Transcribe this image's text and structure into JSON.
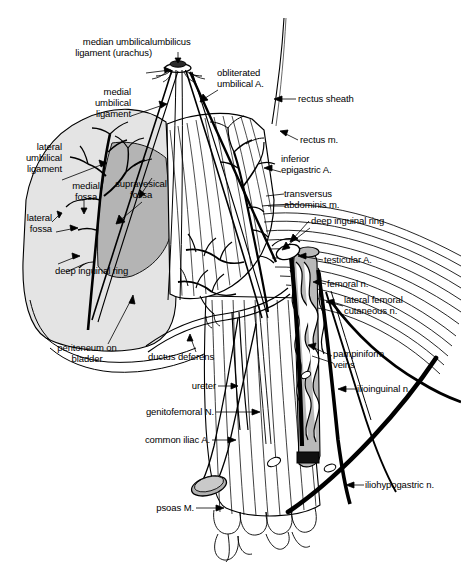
{
  "figure": {
    "width": 461,
    "height": 574,
    "background": "#ffffff",
    "ink": "#000000",
    "shade_light": "#e2e2e2",
    "shade_mid": "#c9c9c9",
    "shade_dark": "#9e9e9e"
  },
  "labels": [
    {
      "id": "umbilicus",
      "text": "umbilicus",
      "x": 152,
      "y": 41,
      "align": "l"
    },
    {
      "id": "median-umbilical-ligament",
      "text": "median umbilical\nligament (urachus)",
      "x": 55,
      "y": 54,
      "align": "l"
    },
    {
      "id": "medial-umbilical-ligament",
      "text": "medial\numbilical\nligament",
      "x": 79,
      "y": 91,
      "align": "l"
    },
    {
      "id": "lateral-umbilical-ligament",
      "text": "lateral\numbilical\nligament",
      "x": 25,
      "y": 145,
      "align": "l"
    },
    {
      "id": "medial-fossa",
      "text": "medial\nfossa",
      "x": 72,
      "y": 184,
      "align": "l"
    },
    {
      "id": "supravesical-fossa",
      "text": "supravesical\nfossa",
      "x": 108,
      "y": 182,
      "align": "l"
    },
    {
      "id": "lateral-fossa",
      "text": "lateral\nfossa",
      "x": 23,
      "y": 215,
      "align": "l"
    },
    {
      "id": "deep-inguinal-ring-left",
      "text": "deep inguinal ring",
      "x": 55,
      "y": 269,
      "align": "l"
    },
    {
      "id": "peritoneum-on-bladder",
      "text": "peritoneum on\nbladder",
      "x": 57,
      "y": 347,
      "align": "l"
    },
    {
      "id": "ductus-deferens",
      "text": "ductus deferens",
      "x": 148,
      "y": 355,
      "align": "l"
    },
    {
      "id": "ureter",
      "text": "ureter",
      "x": 189,
      "y": 382,
      "align": "l"
    },
    {
      "id": "genitofemoral-nerve",
      "text": "genitofemoral N.",
      "x": 141,
      "y": 409,
      "align": "l"
    },
    {
      "id": "common-iliac-artery",
      "text": "common iliac A.",
      "x": 139,
      "y": 436,
      "align": "l"
    },
    {
      "id": "psoas-muscle",
      "text": "psoas M.",
      "x": 156,
      "y": 504,
      "align": "l"
    },
    {
      "id": "obliterated-umbilical-artery",
      "text": "obliterated\numbilical A.",
      "x": 217,
      "y": 71,
      "align": "l"
    },
    {
      "id": "rectus-sheath",
      "text": "rectus sheath",
      "x": 298,
      "y": 95,
      "align": "l"
    },
    {
      "id": "rectus-muscle",
      "text": "rectus m.",
      "x": 300,
      "y": 137,
      "align": "l"
    },
    {
      "id": "inferior-epigastric-artery",
      "text": "inferior\nepigastric A.",
      "x": 283,
      "y": 157,
      "align": "l"
    },
    {
      "id": "transversus-abdominis",
      "text": "transversus\nabdominis m.",
      "x": 286,
      "y": 190,
      "align": "l"
    },
    {
      "id": "deep-inguinal-ring-right",
      "text": "deep inguinal ring",
      "x": 311,
      "y": 217,
      "align": "l"
    },
    {
      "id": "testicular-artery",
      "text": "testicular A.",
      "x": 325,
      "y": 257,
      "align": "l"
    },
    {
      "id": "femoral-nerve",
      "text": "femoral n.",
      "x": 328,
      "y": 281,
      "align": "l"
    },
    {
      "id": "lateral-femoral-cutaneous-nerve",
      "text": "lateral femoral\ncutaneous n.",
      "x": 345,
      "y": 296,
      "align": "l"
    },
    {
      "id": "pampiniform-veins",
      "text": "pampiniform\nveins",
      "x": 334,
      "y": 351,
      "align": "l"
    },
    {
      "id": "ilioinguinal-nerve",
      "text": "ilioinguinal n.",
      "x": 358,
      "y": 385,
      "align": "l"
    },
    {
      "id": "iliohypogastric-nerve",
      "text": "iliohypogastric n.",
      "x": 366,
      "y": 481,
      "align": "l"
    }
  ]
}
